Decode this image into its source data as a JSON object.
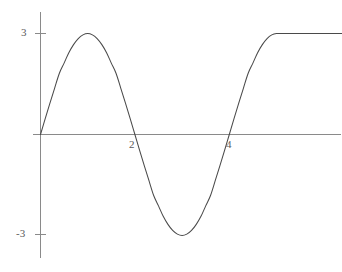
{
  "chart_data": {
    "type": "line",
    "title": "",
    "subtitle": "",
    "xlabel": "",
    "ylabel": "",
    "grid": false,
    "legend": null,
    "xlim": [
      -0.85,
      6.4
    ],
    "ylim": [
      -4.35,
      3.6
    ],
    "x_ticks": [
      2,
      4
    ],
    "x_tick_labels": [
      "2",
      "4"
    ],
    "y_ticks": [
      3,
      -3
    ],
    "y_tick_labels": [
      "3",
      "-3"
    ],
    "axis_color": "#8a8a8a",
    "curve_color": "#4a4a4a",
    "label_color": "#5a5a5a",
    "background_color": "#ffffff",
    "series": [
      {
        "name": "y = 3 sin(pi x / 2), clamped at 3",
        "x": [
          0,
          0.1,
          0.2,
          0.3,
          0.4,
          0.5,
          0.6,
          0.7,
          0.8,
          0.9,
          1,
          1.1,
          1.2,
          1.3,
          1.4,
          1.5,
          1.6,
          1.7,
          1.8,
          1.9,
          2,
          2.1,
          2.2,
          2.3,
          2.4,
          2.5,
          2.6,
          2.7,
          2.8,
          2.9,
          3,
          3.1,
          3.2,
          3.3,
          3.4,
          3.5,
          3.6,
          3.7,
          3.8,
          3.9,
          4,
          4.1,
          4.2,
          4.3,
          4.4,
          4.5,
          4.6,
          4.7,
          4.8,
          4.9,
          5,
          5.2,
          5.4,
          5.6,
          5.8,
          6,
          6.2,
          6.4
        ],
        "y": [
          0,
          0.47,
          0.93,
          1.38,
          1.82,
          2.12,
          2.43,
          2.67,
          2.85,
          2.96,
          3,
          2.96,
          2.85,
          2.67,
          2.43,
          2.12,
          1.82,
          1.38,
          0.93,
          0.47,
          0,
          -0.47,
          -0.93,
          -1.38,
          -1.82,
          -2.12,
          -2.43,
          -2.67,
          -2.85,
          -2.96,
          -3,
          -2.96,
          -2.85,
          -2.67,
          -2.43,
          -2.12,
          -1.82,
          -1.38,
          -0.93,
          -0.47,
          0,
          0.47,
          0.93,
          1.38,
          1.82,
          2.12,
          2.43,
          2.67,
          2.85,
          2.96,
          3,
          3,
          3,
          3,
          3,
          3,
          3,
          3
        ]
      }
    ],
    "annotations": {
      "peak_value": 3,
      "peak_x": 1,
      "trough_value": -3,
      "trough_x": 3,
      "zero_crossings": [
        0,
        2,
        4
      ],
      "plateau_start_x": 5,
      "plateau_value": 3
    }
  }
}
